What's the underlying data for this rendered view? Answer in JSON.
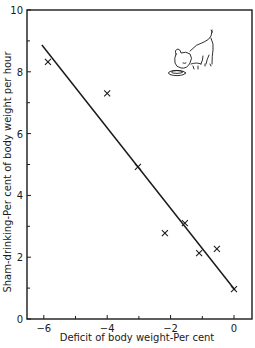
{
  "chart_data": {
    "type": "scatter",
    "title": "",
    "xlabel": "Deficit of body weight-Per cent",
    "ylabel": "Sham-drinking-Per cent of body weight per hour",
    "xlim": [
      -6.55,
      0.57
    ],
    "ylim": [
      0,
      10
    ],
    "x_major_ticks": [
      -6,
      -4,
      -2,
      0
    ],
    "x_minor_ticks": [
      -5,
      -3,
      -1
    ],
    "y_major_ticks": [
      0,
      2,
      4,
      6,
      8,
      10
    ],
    "y_minor_ticks": [
      1,
      3,
      5,
      7,
      9
    ],
    "grid": false,
    "legend": null,
    "marker": "x",
    "series": [
      {
        "name": "observations",
        "points": [
          {
            "x": -5.87,
            "y": 8.32
          },
          {
            "x": -4.0,
            "y": 7.3
          },
          {
            "x": -3.03,
            "y": 4.92
          },
          {
            "x": -2.18,
            "y": 2.78
          },
          {
            "x": -1.55,
            "y": 3.1
          },
          {
            "x": -1.1,
            "y": 2.13
          },
          {
            "x": -0.54,
            "y": 2.27
          },
          {
            "x": 0.0,
            "y": 0.97
          }
        ]
      }
    ],
    "fit_line": {
      "type": "linear",
      "from": {
        "x": -6.06,
        "y": 8.87
      },
      "to": {
        "x": 0.03,
        "y": 0.94
      }
    },
    "annotation": "illustration of a dog drinking from a bowl (upper right)"
  },
  "layout": {
    "plot_px": {
      "left": 27,
      "top": 10,
      "right": 252,
      "bottom": 319
    },
    "x_zero_px": 234,
    "x_unit_px": 31.7
  }
}
